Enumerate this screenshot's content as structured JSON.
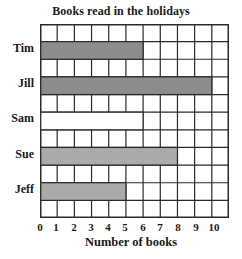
{
  "chart_data": {
    "type": "bar",
    "orientation": "horizontal",
    "title": "Books read in the holidays",
    "xlabel": "Number of books",
    "ylabel": "",
    "categories": [
      "Tim",
      "Jill",
      "Sam",
      "Sue",
      "Jeff"
    ],
    "values": [
      6,
      10,
      6,
      8,
      5
    ],
    "bar_fill": [
      "#8c8c8c",
      "#8c8c8c",
      "#ffffff",
      "#aaaaaa",
      "#aaaaaa"
    ],
    "xticks": [
      "0",
      "1",
      "2",
      "3",
      "4",
      "5",
      "6",
      "7",
      "8",
      "9",
      "10"
    ],
    "xlim": [
      0,
      11
    ],
    "grid": true
  },
  "colors": {
    "grid_line": "#2a2a2a",
    "dark_bar": "#8c8c8c",
    "light_bar": "#aaaaaa"
  }
}
